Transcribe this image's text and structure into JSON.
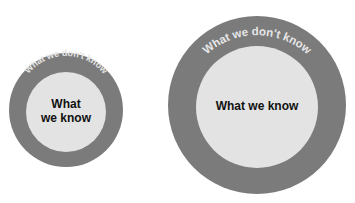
{
  "diagram": {
    "type": "concentric-circles-comparison",
    "colors": {
      "outer_ring": "#7b7b7b",
      "inner_core": "#e3e3e3",
      "ring_text": "#e6e6e6",
      "core_text": "#111111",
      "background": "#ffffff"
    },
    "small": {
      "outer_label": "What we don't know",
      "inner_label_line1": "What",
      "inner_label_line2": "we know"
    },
    "large": {
      "outer_label": "What we don't know",
      "inner_label": "What we know"
    }
  }
}
